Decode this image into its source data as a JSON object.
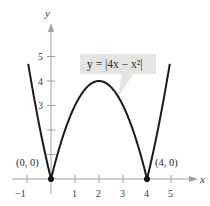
{
  "chart_data": {
    "type": "line",
    "title": "",
    "xlabel": "x",
    "ylabel": "y",
    "xlim": [
      -1.3,
      5.6
    ],
    "ylim": [
      -0.4,
      6.3
    ],
    "grid": false,
    "x_ticks": [
      -1,
      1,
      2,
      3,
      4,
      5
    ],
    "y_ticks": [
      1,
      2,
      3,
      4,
      5
    ],
    "series": [
      {
        "name": "y = |4x − x²|",
        "function": "abs(4*x - x*x)",
        "x_range": [
          -0.95,
          4.95
        ],
        "color": "#1a1a1a"
      }
    ],
    "annotations": [
      {
        "text": "y = |4x − x²|",
        "type": "callout-box",
        "anchor_x": 2.6,
        "anchor_y": 3.3
      },
      {
        "text": "(0, 0)",
        "type": "point",
        "x": 0,
        "y": 0
      },
      {
        "text": "(4, 0)",
        "type": "point",
        "x": 4,
        "y": 0
      }
    ]
  },
  "labels": {
    "x_axis": "x",
    "y_axis": "y",
    "equation": "y = |4x − x²|",
    "point_left": "(0, 0)",
    "point_right": "(4, 0)",
    "x_tick_neg1": "−1",
    "x_tick_1": "1",
    "x_tick_2": "2",
    "x_tick_3": "3",
    "x_tick_4": "4",
    "x_tick_5": "5",
    "y_tick_3": "3",
    "y_tick_4": "4",
    "y_tick_5": "5"
  },
  "colors": {
    "curve": "#1a1a1a",
    "axis": "#9a9a9a",
    "callout_fill": "#e4e4e4",
    "point": "#111111"
  }
}
